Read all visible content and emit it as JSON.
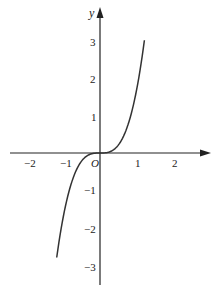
{
  "chart_data": {
    "type": "line",
    "title": "",
    "xlabel": "",
    "ylabel": "y",
    "origin_label": "O",
    "xlim": [
      -2.4,
      2.9
    ],
    "ylim": [
      -3.5,
      3.9
    ],
    "x_ticks": [
      -2,
      -1,
      1,
      2
    ],
    "x_tick_labels": [
      "−2",
      "−1",
      "1",
      "2"
    ],
    "y_ticks": [
      3,
      2,
      1,
      -1,
      -2,
      -3
    ],
    "y_tick_labels": [
      "3",
      "2",
      "1",
      "−1",
      "−2",
      "−3"
    ],
    "grid": false,
    "legend": null,
    "series": [
      {
        "name": "curve",
        "description": "odd cubic-like curve through origin, approx y = 1.74x^3",
        "x": [
          -1.17,
          -1.0,
          -0.8,
          -0.6,
          -0.4,
          -0.2,
          0,
          0.2,
          0.4,
          0.6,
          0.8,
          1.0,
          1.2
        ],
        "y": [
          -2.8,
          -1.74,
          -0.89,
          -0.38,
          -0.11,
          -0.01,
          0,
          0.01,
          0.11,
          0.38,
          0.89,
          1.74,
          3.0
        ]
      }
    ]
  },
  "colors": {
    "axis": "#222222",
    "curve": "#333333",
    "background": "#ffffff"
  }
}
